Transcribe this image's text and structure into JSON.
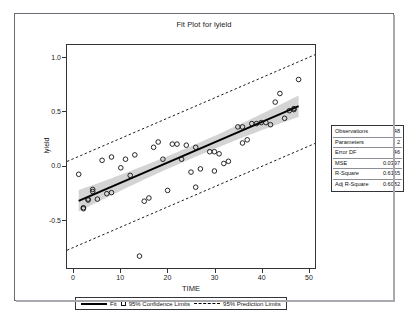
{
  "chart_data": {
    "type": "scatter",
    "title": "Fit Plot for lyield",
    "xlabel": "TIME",
    "ylabel": "lyield",
    "xlim": [
      -1.5,
      51.5
    ],
    "ylim": [
      -0.95,
      1.12
    ],
    "xticks": [
      0,
      10,
      20,
      30,
      40,
      50
    ],
    "xticklabels": [
      "0",
      "10",
      "20",
      "30",
      "40",
      "50"
    ],
    "yticks": [
      -0.5,
      0.0,
      0.5,
      1.0
    ],
    "yticklabels": [
      "-0.5",
      "0.0",
      "0.5",
      "1.0"
    ],
    "grid": false,
    "legend_position": "bottom",
    "fit_line": {
      "name": "Fit",
      "intercept": -0.345,
      "slope": 0.0187,
      "x_start": 1,
      "x_end": 48
    },
    "confidence_band": {
      "name": "95% Confidence Limits",
      "level": 0.95,
      "half_width_center": 0.0575,
      "half_width_edge": 0.1
    },
    "prediction_band": {
      "name": "95% Prediction Limits",
      "level": 0.95,
      "half_width": 0.412
    },
    "points": [
      {
        "x": 1,
        "y": -0.08
      },
      {
        "x": 2,
        "y": -0.39
      },
      {
        "x": 2,
        "y": -0.4
      },
      {
        "x": 3,
        "y": -0.31
      },
      {
        "x": 3,
        "y": -0.32
      },
      {
        "x": 4,
        "y": -0.22
      },
      {
        "x": 4,
        "y": -0.24
      },
      {
        "x": 5,
        "y": -0.31
      },
      {
        "x": 6,
        "y": 0.05
      },
      {
        "x": 7,
        "y": -0.26
      },
      {
        "x": 8,
        "y": -0.25
      },
      {
        "x": 8,
        "y": 0.08
      },
      {
        "x": 10,
        "y": -0.02
      },
      {
        "x": 11,
        "y": 0.06
      },
      {
        "x": 12,
        "y": -0.09
      },
      {
        "x": 13,
        "y": 0.1
      },
      {
        "x": 14,
        "y": -0.84
      },
      {
        "x": 15,
        "y": -0.33
      },
      {
        "x": 16,
        "y": -0.3
      },
      {
        "x": 17,
        "y": 0.17
      },
      {
        "x": 18,
        "y": 0.22
      },
      {
        "x": 19,
        "y": 0.06
      },
      {
        "x": 20,
        "y": -0.23
      },
      {
        "x": 21,
        "y": 0.2
      },
      {
        "x": 22,
        "y": 0.2
      },
      {
        "x": 23,
        "y": 0.06
      },
      {
        "x": 24,
        "y": 0.19
      },
      {
        "x": 25,
        "y": -0.06
      },
      {
        "x": 26,
        "y": 0.17
      },
      {
        "x": 26,
        "y": -0.2
      },
      {
        "x": 27,
        "y": -0.03
      },
      {
        "x": 29,
        "y": 0.13
      },
      {
        "x": 30,
        "y": 0.13
      },
      {
        "x": 30,
        "y": -0.05
      },
      {
        "x": 31,
        "y": 0.11
      },
      {
        "x": 32,
        "y": 0.02
      },
      {
        "x": 33,
        "y": 0.04
      },
      {
        "x": 35,
        "y": 0.36
      },
      {
        "x": 36,
        "y": 0.21
      },
      {
        "x": 36,
        "y": 0.36
      },
      {
        "x": 37,
        "y": 0.24
      },
      {
        "x": 38,
        "y": 0.39
      },
      {
        "x": 39,
        "y": 0.39
      },
      {
        "x": 40,
        "y": 0.4
      },
      {
        "x": 41,
        "y": 0.4
      },
      {
        "x": 42,
        "y": 0.38
      },
      {
        "x": 43,
        "y": 0.59
      },
      {
        "x": 44,
        "y": 0.67
      },
      {
        "x": 45,
        "y": 0.44
      },
      {
        "x": 46,
        "y": 0.51
      },
      {
        "x": 47,
        "y": 0.52
      },
      {
        "x": 47,
        "y": 0.53
      },
      {
        "x": 48,
        "y": 0.8
      }
    ]
  },
  "stats_box": {
    "rows": [
      {
        "key": "Observations",
        "value": "48"
      },
      {
        "key": "Parameters",
        "value": "2"
      },
      {
        "key": "Error DF",
        "value": "46"
      },
      {
        "key": "MSE",
        "value": "0.0397"
      },
      {
        "key": "R-Square",
        "value": "0.6165"
      },
      {
        "key": "Adj R-Square",
        "value": "0.6082"
      }
    ]
  },
  "legend": {
    "fit_label": "Fit",
    "confidence_label": "95% Confidence Limits",
    "prediction_label": "95% Prediction Limits"
  },
  "colors": {
    "fit_line": "#000000",
    "confidence_band": "#d4d4d4",
    "prediction_line": "#000000",
    "marker_stroke": "#111111",
    "axis": "#33333a",
    "frame": "#6b6b73"
  }
}
